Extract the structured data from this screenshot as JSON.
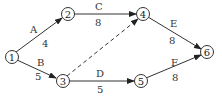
{
  "diagram": {
    "type": "activity-on-arrow network",
    "nodes": [
      {
        "id": "1",
        "label": "1",
        "x": 12,
        "y": 57
      },
      {
        "id": "2",
        "label": "2",
        "x": 68,
        "y": 14
      },
      {
        "id": "3",
        "label": "3",
        "x": 63,
        "y": 81
      },
      {
        "id": "4",
        "label": "4",
        "x": 143,
        "y": 14
      },
      {
        "id": "5",
        "label": "5",
        "x": 141,
        "y": 81
      },
      {
        "id": "6",
        "label": "6",
        "x": 207,
        "y": 52
      }
    ],
    "edges": [
      {
        "from": "1",
        "to": "2",
        "activity": "A",
        "duration": "4",
        "dashed": false
      },
      {
        "from": "1",
        "to": "3",
        "activity": "B",
        "duration": "5",
        "dashed": false
      },
      {
        "from": "2",
        "to": "4",
        "activity": "C",
        "duration": "8",
        "dashed": false
      },
      {
        "from": "3",
        "to": "4",
        "activity": "",
        "duration": "",
        "dashed": true
      },
      {
        "from": "3",
        "to": "5",
        "activity": "D",
        "duration": "5",
        "dashed": false
      },
      {
        "from": "4",
        "to": "6",
        "activity": "E",
        "duration": "8",
        "dashed": false
      },
      {
        "from": "5",
        "to": "6",
        "activity": "F",
        "duration": "8",
        "dashed": false
      }
    ]
  }
}
